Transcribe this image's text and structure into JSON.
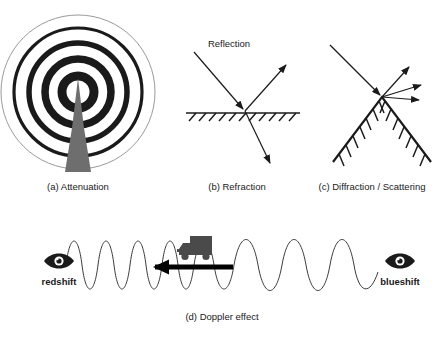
{
  "figure": {
    "title_implicit": "Radio wave propagation phenomena",
    "background_color": "#ffffff",
    "ink_color": "#1a1a1a",
    "tower_color": "#6e6e6e",
    "truck_color": "#4a4a4a",
    "wave_color": "#3a3a3a"
  },
  "panels": [
    {
      "id": "a",
      "caption": "(a) Attenuation",
      "description": "concentric rings radiating from an antenna tower",
      "rings": [
        {
          "radius": 16,
          "stroke_width": 9
        },
        {
          "radius": 33,
          "stroke_width": 7.5
        },
        {
          "radius": 49,
          "stroke_width": 5.5
        },
        {
          "radius": 64,
          "stroke_width": 3.2
        },
        {
          "radius": 77,
          "stroke_width": 1.0
        }
      ],
      "center": {
        "x": 78,
        "y": 92
      }
    },
    {
      "id": "b",
      "caption": "(b) Refraction",
      "label": "Reflection",
      "rays": [
        {
          "name": "incident-ray",
          "from": [
            194,
            52
          ],
          "to": [
            245,
            111
          ]
        },
        {
          "name": "reflected-ray",
          "from": [
            245,
            111
          ],
          "to": [
            288,
            63
          ]
        },
        {
          "name": "refracted-ray",
          "from": [
            245,
            111
          ],
          "to": [
            272,
            166
          ]
        }
      ],
      "surface": {
        "x1": 186,
        "x2": 300,
        "y": 113
      }
    },
    {
      "id": "c",
      "caption": "(c) Diffraction / Scattering",
      "rays": [
        {
          "name": "incident-ray",
          "from": [
            330,
            45
          ],
          "to": [
            382,
            97
          ]
        },
        {
          "name": "scattered-ray-1",
          "from": [
            382,
            97
          ],
          "to": [
            411,
            65
          ]
        },
        {
          "name": "scattered-ray-2",
          "from": [
            382,
            97
          ],
          "to": [
            424,
            84
          ]
        },
        {
          "name": "scattered-ray-3",
          "from": [
            382,
            97
          ],
          "to": [
            422,
            99
          ]
        }
      ],
      "wedge": {
        "apex": [
          382,
          97
        ],
        "left": [
          333,
          162
        ],
        "right": [
          431,
          162
        ]
      }
    },
    {
      "id": "d",
      "caption": "(d) Doppler effect",
      "left_label": "redshift",
      "right_label": "blueshift",
      "left_icon": "eye-icon",
      "right_icon": "eye-icon",
      "source_icon": "truck-icon",
      "motion_direction": "left",
      "wave": {
        "baseline_y": 265,
        "amplitude": 32,
        "x_start": 66,
        "x_end": 378,
        "compressed_cycles": 4,
        "stretched_cycles": 4,
        "note": "short wavelengths ahead of the moving source, long wavelengths behind"
      }
    }
  ]
}
